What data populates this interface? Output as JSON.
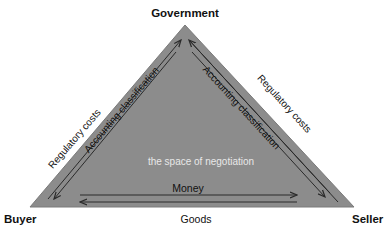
{
  "diagram": {
    "nodes": {
      "top": "Government",
      "left": "Buyer",
      "right": "Seller"
    },
    "left_edge": {
      "outer_label": "Regulatory costs",
      "inner_label": "Accounting classification"
    },
    "right_edge": {
      "outer_label": "Regulatory costs",
      "inner_label": "Accounting classification"
    },
    "bottom_edge": {
      "inner_label": "Money",
      "outer_label": "Goods"
    },
    "center_label": "the space of negotiation",
    "colors": {
      "fill": "#8c8c8c",
      "line": "#2a2a2a",
      "center_text": "#e8e8e8",
      "text": "#111111"
    }
  }
}
